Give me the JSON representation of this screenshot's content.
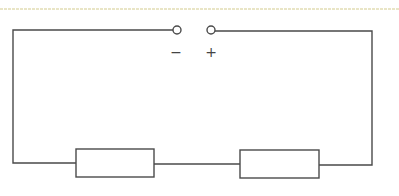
{
  "diagram": {
    "type": "circuit",
    "colors": {
      "wire": "#4a4a4a",
      "top_rule": "#e2ddb4",
      "background": "#ffffff"
    },
    "terminals": [
      {
        "id": "negative",
        "label": "−",
        "x": 177,
        "y": 30
      },
      {
        "id": "positive",
        "label": "+",
        "x": 211,
        "y": 30
      }
    ],
    "components": [
      {
        "id": "resistor-1",
        "type": "resistor",
        "x": 76,
        "y": 149,
        "width": 78,
        "height": 28
      },
      {
        "id": "resistor-2",
        "type": "resistor",
        "x": 240,
        "y": 150,
        "width": 79,
        "height": 28
      }
    ]
  }
}
